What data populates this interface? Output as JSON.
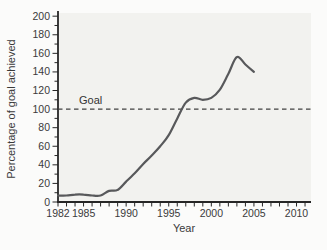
{
  "chart_data": {
    "type": "line",
    "title": "",
    "xlabel": "Year",
    "ylabel": "Percentage of goal achieved",
    "goal_label": "Goal",
    "goal_value": 100,
    "x": [
      1982,
      1983,
      1984,
      1985,
      1986,
      1987,
      1988,
      1989,
      1990,
      1991,
      1992,
      1993,
      1994,
      1995,
      1996,
      1997,
      1998,
      1999,
      2000,
      2001,
      2002,
      2003,
      2004,
      2005
    ],
    "values": [
      7,
      7,
      8,
      8,
      7,
      7,
      12,
      13,
      22,
      31,
      41,
      50,
      60,
      72,
      90,
      107,
      112,
      110,
      112,
      121,
      138,
      156,
      148,
      140
    ],
    "xlim": [
      1982,
      2011.7
    ],
    "ylim": [
      0,
      200
    ],
    "x_major_ticks": [
      1982,
      1985,
      1990,
      1995,
      2000,
      2005,
      2010
    ],
    "x_minor_tick_step": 1,
    "y_major_tick_step": 20,
    "y_minor_tick_step": 10,
    "grid": false,
    "legend": "none",
    "colors": {
      "line": "#58595b",
      "axis": "#262626",
      "goal_line": "#404040",
      "plot_bg": "#f2f2ef",
      "page_bg": "#fbfbfa",
      "text": "#3a3a3a"
    }
  }
}
